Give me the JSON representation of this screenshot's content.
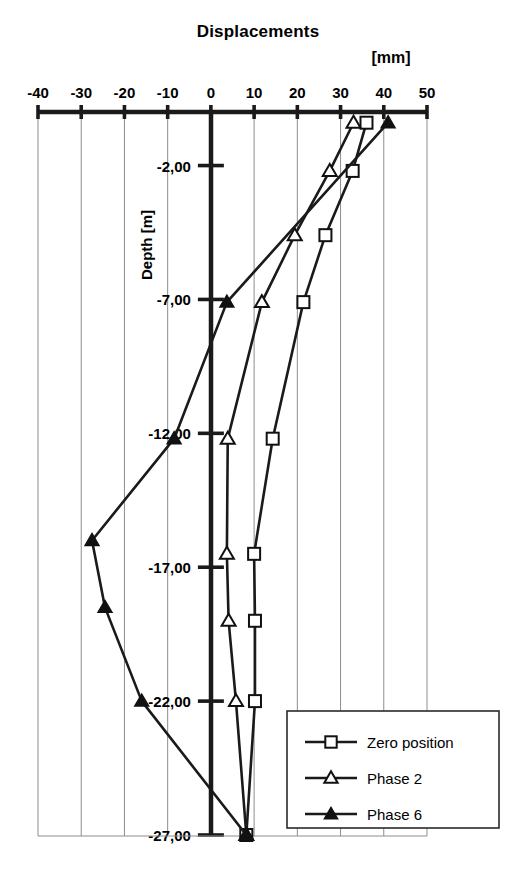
{
  "chart_data": {
    "type": "line",
    "title": "Displacements",
    "unit_label": "[mm]",
    "xlabel": "",
    "ylabel": "Depth [m]",
    "orientation": "horizontal-x-displacement-vertical-depth",
    "xlim": [
      -40,
      50
    ],
    "ylim": [
      -27.5,
      0
    ],
    "xticks": [
      -40,
      -30,
      -20,
      -10,
      0,
      10,
      20,
      30,
      40,
      50
    ],
    "xtick_labels": [
      "-40",
      "-30",
      "-20",
      "-10",
      "0",
      "10",
      "20",
      "30",
      "40",
      "50"
    ],
    "yticks": [
      -2,
      -7,
      -12,
      -17,
      -22,
      -27
    ],
    "ytick_labels": [
      "-2,00",
      "-7,00",
      "-12,00",
      "-17,00",
      "-22,00",
      "-27,00"
    ],
    "grid": true,
    "grid_axis": "x",
    "legend_position": "bottom-right",
    "series": [
      {
        "name": "Zero position",
        "marker": "open-square",
        "depths": [
          -0.4,
          -2.2,
          -4.6,
          -7.1,
          -12.2,
          -16.5,
          -19.0,
          -22.0,
          -27.0
        ],
        "values": [
          36.0,
          32.8,
          26.5,
          21.4,
          14.3,
          10.0,
          10.2,
          10.2,
          8.2
        ]
      },
      {
        "name": "Phase 2",
        "marker": "open-triangle",
        "depths": [
          -0.4,
          -2.2,
          -4.6,
          -7.1,
          -12.2,
          -16.5,
          -19.0,
          -22.0,
          -27.0
        ],
        "values": [
          33.0,
          27.5,
          19.4,
          11.8,
          3.9,
          3.7,
          4.1,
          5.8,
          8.2
        ]
      },
      {
        "name": "Phase 6",
        "marker": "solid-triangle",
        "depths": [
          -0.4,
          -7.1,
          -12.2,
          -16.0,
          -18.5,
          -22.0,
          -27.0
        ],
        "values": [
          41.0,
          3.7,
          -8.5,
          -27.5,
          -24.5,
          -16.0,
          8.2
        ]
      }
    ]
  },
  "legend": {
    "items": [
      {
        "label": "Zero position",
        "marker": "open-square"
      },
      {
        "label": "Phase 2",
        "marker": "open-triangle"
      },
      {
        "label": "Phase 6",
        "marker": "solid-triangle"
      }
    ]
  }
}
